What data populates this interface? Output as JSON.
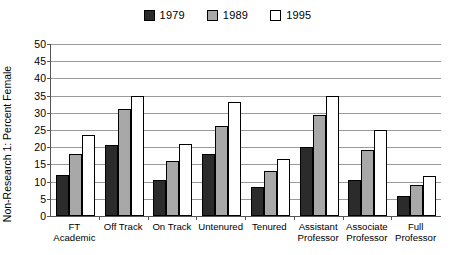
{
  "chart_data": {
    "type": "bar",
    "title": "",
    "xlabel": "",
    "ylabel": "Non-Research 1: Percent Female",
    "ylim": [
      0,
      50
    ],
    "ytick_step": 5,
    "yticks": [
      0,
      5,
      10,
      15,
      20,
      25,
      30,
      35,
      40,
      45,
      50
    ],
    "grid": true,
    "legend_position": "top-center",
    "categories": [
      "FT Academic",
      "Off Track",
      "On Track",
      "Untenured",
      "Tenured",
      "Assistant\nProfessor",
      "Associate\nProfessor",
      "Full\nProfessor"
    ],
    "series": [
      {
        "name": "1979",
        "color": "#2b2b2b",
        "values": [
          12.0,
          20.5,
          10.4,
          18.0,
          8.3,
          20.0,
          10.5,
          5.8
        ]
      },
      {
        "name": "1989",
        "color": "#a8a8a8",
        "values": [
          18.1,
          31.0,
          16.0,
          26.2,
          13.0,
          29.3,
          19.1,
          9.1
        ]
      },
      {
        "name": "1995",
        "color": "#ffffff",
        "values": [
          23.5,
          35.0,
          21.0,
          33.0,
          16.6,
          34.8,
          25.0,
          11.6
        ]
      }
    ]
  }
}
